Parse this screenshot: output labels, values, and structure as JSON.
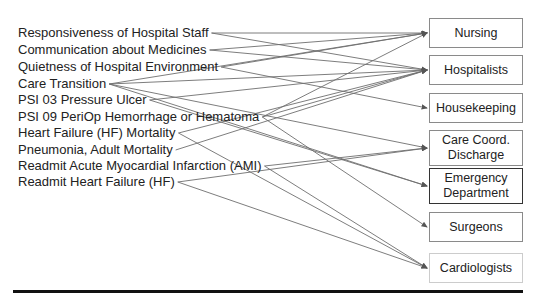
{
  "metrics": [
    {
      "label": "Responsiveness of Hospital Staff",
      "y": 33
    },
    {
      "label": "Communication about Medicines",
      "y": 50
    },
    {
      "label": "Quietness of Hospital Environment",
      "y": 67
    },
    {
      "label": "Care Transition",
      "y": 84
    },
    {
      "label": "PSI 03 Pressure Ulcer",
      "y": 100
    },
    {
      "label": "PSI 09 PeriOp Hemorrhage or Hematoma",
      "y": 117
    },
    {
      "label": "Heart Failure (HF) Mortality",
      "y": 133
    },
    {
      "label": "Pneumonia, Adult Mortality",
      "y": 150
    },
    {
      "label": "Readmit Acute Myocardial Infarction (AMI)",
      "y": 166
    },
    {
      "label": "Readmit Heart Failure (HF)",
      "y": 182
    }
  ],
  "departments": [
    {
      "label": "Nursing",
      "y": 33
    },
    {
      "label": "Hospitalists",
      "y": 70
    },
    {
      "label": "Housekeeping",
      "y": 108
    },
    {
      "label": "Care Coord. Discharge",
      "y": 148
    },
    {
      "label": "Emergency Department",
      "y": 186
    },
    {
      "label": "Surgeons",
      "y": 227
    },
    {
      "label": "Cardiologists",
      "y": 268
    }
  ],
  "links": [
    {
      "from": "Responsiveness of Hospital Staff",
      "to": "Nursing"
    },
    {
      "from": "Responsiveness of Hospital Staff",
      "to": "Hospitalists"
    },
    {
      "from": "Communication about Medicines",
      "to": "Nursing"
    },
    {
      "from": "Communication about Medicines",
      "to": "Hospitalists"
    },
    {
      "from": "Quietness of Hospital Environment",
      "to": "Nursing"
    },
    {
      "from": "Quietness of Hospital Environment",
      "to": "Housekeeping"
    },
    {
      "from": "Care Transition",
      "to": "Nursing"
    },
    {
      "from": "Care Transition",
      "to": "Hospitalists"
    },
    {
      "from": "Care Transition",
      "to": "Care Coord. Discharge"
    },
    {
      "from": "Care Transition",
      "to": "Emergency Department"
    },
    {
      "from": "PSI 03 Pressure Ulcer",
      "to": "Hospitalists"
    },
    {
      "from": "PSI 03 Pressure Ulcer",
      "to": "Emergency Department"
    },
    {
      "from": "PSI 09 PeriOp Hemorrhage or Hematoma",
      "to": "Nursing"
    },
    {
      "from": "PSI 09 PeriOp Hemorrhage or Hematoma",
      "to": "Hospitalists"
    },
    {
      "from": "PSI 09 PeriOp Hemorrhage or Hematoma",
      "to": "Surgeons"
    },
    {
      "from": "Heart Failure (HF) Mortality",
      "to": "Hospitalists"
    },
    {
      "from": "Heart Failure (HF) Mortality",
      "to": "Cardiologists"
    },
    {
      "from": "Pneumonia, Adult Mortality",
      "to": "Hospitalists"
    },
    {
      "from": "Readmit Acute Myocardial Infarction (AMI)",
      "to": "Care Coord. Discharge"
    },
    {
      "from": "Readmit Acute Myocardial Infarction (AMI)",
      "to": "Cardiologists"
    },
    {
      "from": "Readmit Heart Failure (HF)",
      "to": "Care Coord. Discharge"
    },
    {
      "from": "Readmit Heart Failure (HF)",
      "to": "Cardiologists"
    }
  ],
  "colors": {
    "line": "#6e6e6e",
    "arrow": "#555555",
    "rule": "#111111"
  }
}
